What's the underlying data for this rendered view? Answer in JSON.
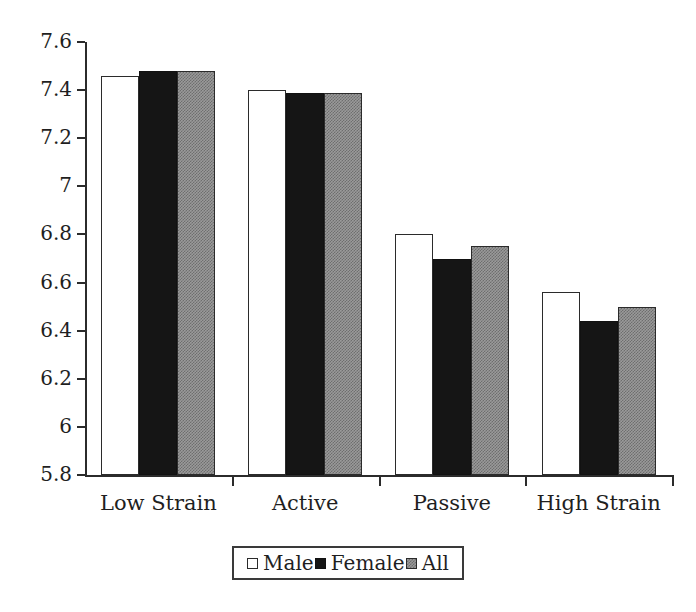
{
  "chart_data": {
    "type": "bar",
    "title": "",
    "subtitle": "",
    "xlabel": "",
    "ylabel": "",
    "categories": [
      "Low Strain",
      "Active",
      "Passive",
      "High Strain"
    ],
    "series": [
      {
        "name": "Male",
        "values": [
          7.46,
          7.4,
          6.8,
          6.56
        ],
        "fill": "#ffffff",
        "swatch": "white-square"
      },
      {
        "name": "Female",
        "values": [
          7.48,
          7.39,
          6.7,
          6.44
        ],
        "fill": "#151515",
        "swatch": "black-square"
      },
      {
        "name": "All",
        "values": [
          7.48,
          7.39,
          6.75,
          6.5
        ],
        "fill": "#9a9a9a",
        "swatch": "gray-square"
      }
    ],
    "ylim": [
      5.8,
      7.6
    ],
    "ytick_labels": [
      "7.6",
      "7.4",
      "7.2",
      "7",
      "6.8",
      "6.6",
      "6.4",
      "6.2",
      "6",
      "5.8"
    ],
    "ytick_values": [
      7.6,
      7.4,
      7.2,
      7.0,
      6.8,
      6.6,
      6.4,
      6.2,
      6.0,
      5.8
    ],
    "grid": false,
    "legend_position": "bottom-center",
    "axis_color": "#2b2b2b",
    "text_color": "#1f1f1f",
    "background": "#ffffff"
  },
  "legend": {
    "items": [
      {
        "label": "Male",
        "swatch_name": "legend-swatch-male"
      },
      {
        "label": "Female",
        "swatch_name": "legend-swatch-female"
      },
      {
        "label": "All",
        "swatch_name": "legend-swatch-all"
      }
    ]
  }
}
